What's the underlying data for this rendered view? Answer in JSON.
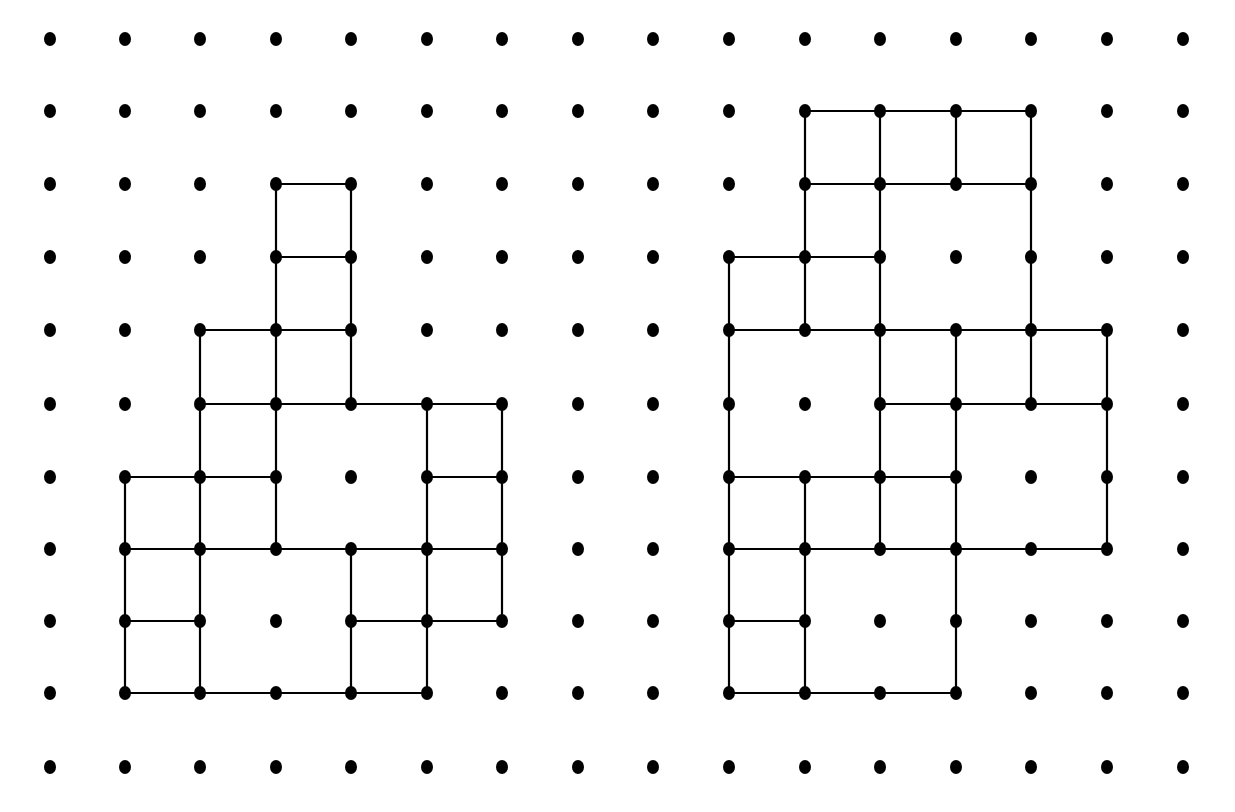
{
  "diagram": {
    "title": "Dot grid with two rectilinear polyomino figures",
    "style": {
      "dot_color": "#000000",
      "line_color": "#000000",
      "background": "#ffffff",
      "dot_rx": 6,
      "dot_ry": 7,
      "line_width": 2.2
    },
    "grid": {
      "columns": 16,
      "rows": 11,
      "x_positions": [
        50,
        125,
        200,
        276,
        351,
        427,
        502,
        578,
        653,
        729,
        805,
        880,
        956,
        1031,
        1107,
        1183
      ],
      "y_positions": [
        39,
        111,
        184,
        257,
        330,
        404,
        477,
        549,
        621,
        693,
        767
      ]
    },
    "figures": [
      {
        "name": "left-figure",
        "horizontal_segments": [
          {
            "row": 2,
            "from": 3,
            "to": 4
          },
          {
            "row": 3,
            "from": 3,
            "to": 4
          },
          {
            "row": 4,
            "from": 2,
            "to": 4
          },
          {
            "row": 5,
            "from": 2,
            "to": 6
          },
          {
            "row": 6,
            "from": 1,
            "to": 3
          },
          {
            "row": 6,
            "from": 5,
            "to": 6
          },
          {
            "row": 7,
            "from": 1,
            "to": 6
          },
          {
            "row": 8,
            "from": 1,
            "to": 2
          },
          {
            "row": 8,
            "from": 4,
            "to": 6
          },
          {
            "row": 9,
            "from": 1,
            "to": 5
          }
        ],
        "vertical_segments": [
          {
            "col": 3,
            "from": 2,
            "to": 7
          },
          {
            "col": 4,
            "from": 2,
            "to": 5
          },
          {
            "col": 2,
            "from": 4,
            "to": 9
          },
          {
            "col": 1,
            "from": 6,
            "to": 9
          },
          {
            "col": 5,
            "from": 5,
            "to": 9
          },
          {
            "col": 6,
            "from": 5,
            "to": 8
          },
          {
            "col": 4,
            "from": 7,
            "to": 9
          }
        ]
      },
      {
        "name": "right-figure",
        "horizontal_segments": [
          {
            "row": 1,
            "from": 10,
            "to": 13
          },
          {
            "row": 2,
            "from": 10,
            "to": 13
          },
          {
            "row": 3,
            "from": 9,
            "to": 11
          },
          {
            "row": 4,
            "from": 9,
            "to": 14
          },
          {
            "row": 5,
            "from": 11,
            "to": 14
          },
          {
            "row": 6,
            "from": 9,
            "to": 12
          },
          {
            "row": 7,
            "from": 9,
            "to": 14
          },
          {
            "row": 8,
            "from": 9,
            "to": 10
          },
          {
            "row": 9,
            "from": 9,
            "to": 12
          }
        ],
        "vertical_segments": [
          {
            "col": 10,
            "from": 1,
            "to": 4
          },
          {
            "col": 11,
            "from": 1,
            "to": 7
          },
          {
            "col": 12,
            "from": 1,
            "to": 2
          },
          {
            "col": 13,
            "from": 1,
            "to": 5
          },
          {
            "col": 9,
            "from": 3,
            "to": 9
          },
          {
            "col": 12,
            "from": 4,
            "to": 9
          },
          {
            "col": 14,
            "from": 4,
            "to": 7
          },
          {
            "col": 10,
            "from": 6,
            "to": 9
          }
        ]
      }
    ]
  }
}
